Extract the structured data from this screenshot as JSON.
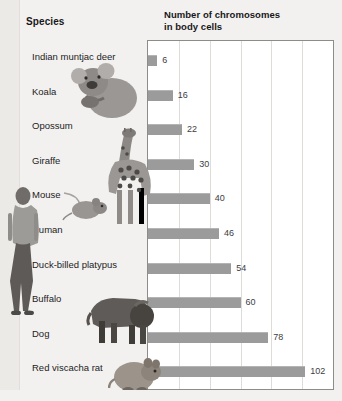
{
  "headers": {
    "species": "Species",
    "chromosomes_line1": "Number of chromosomes",
    "chromosomes_line2": "in body cells"
  },
  "colors": {
    "bar": "#9b9b9b",
    "frame": "#8e8c89",
    "gridline": "#dedcd9",
    "page_background": "#f3f1ef",
    "chart_background": "#ffffff",
    "text": "#1b1c1e"
  },
  "chart_data": {
    "type": "bar",
    "orientation": "horizontal",
    "title": "Number of chromosomes in body cells",
    "xlabel": "Number of chromosomes in body cells",
    "ylabel": "Species",
    "categories": [
      "Indian muntjac deer",
      "Koala",
      "Opossum",
      "Giraffe",
      "Mouse",
      "Human",
      "Duck-billed platypus",
      "Buffalo",
      "Dog",
      "Red viscacha rat"
    ],
    "values": [
      6,
      16,
      22,
      30,
      40,
      46,
      54,
      60,
      78,
      102
    ],
    "value_labels": [
      "6",
      "16",
      "22",
      "30",
      "40",
      "46",
      "54",
      "60",
      "78",
      "102"
    ],
    "xlim": [
      0,
      120
    ],
    "gridlines": [
      20,
      40,
      60,
      80,
      100,
      120
    ],
    "grid": true,
    "legend": "none"
  },
  "illustrations": [
    {
      "name": "human-photo",
      "subject": "Human"
    },
    {
      "name": "koala-photo",
      "subject": "Koala"
    },
    {
      "name": "giraffe-photo",
      "subject": "Giraffe"
    },
    {
      "name": "mouse-photo",
      "subject": "Mouse"
    },
    {
      "name": "buffalo-photo",
      "subject": "Buffalo"
    },
    {
      "name": "viscacha-rat-photo",
      "subject": "Red viscacha rat"
    }
  ]
}
